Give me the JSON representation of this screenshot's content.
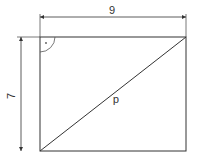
{
  "diagram": {
    "type": "rectangle-with-diagonal",
    "width_label": "9",
    "height_label": "7",
    "diagonal_label": "d",
    "right_angle_marker": true,
    "stroke_color": "#333333",
    "background": "#ffffff"
  }
}
